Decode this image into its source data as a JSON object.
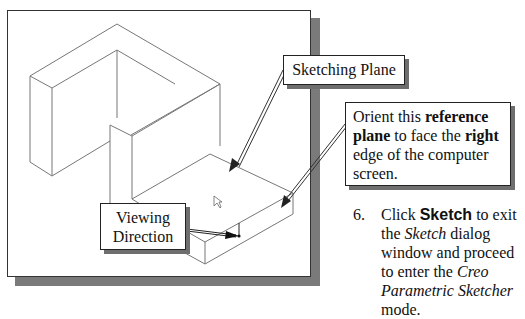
{
  "figure": {
    "callouts": {
      "sketching_plane": "Sketching Plane",
      "viewing_direction_line1": "Viewing",
      "viewing_direction_line2": "Direction",
      "orient": {
        "t1": "Orient this ",
        "b1": "reference",
        "b2": "plane",
        "t2": " to face the ",
        "b3": "right",
        "t3": " edge of the computer screen."
      }
    }
  },
  "instruction": {
    "number": "6.",
    "t1": "Click ",
    "button": "Sketch",
    "t2": " to exit the ",
    "i1": "Sketch",
    "t3": " dialog window and proceed to enter the ",
    "i2": "Creo Parametric Sketcher",
    "t4": " mode."
  }
}
